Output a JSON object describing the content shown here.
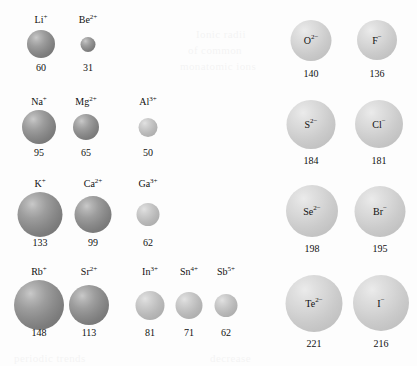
{
  "figure": {
    "background_color": "#fdfdfd",
    "cation_color": "#8b8b8b",
    "cation_light_color": "#bdbdbd",
    "anion_color": "#cbcbcb",
    "text_color": "#111111"
  },
  "bleed_text": [
    {
      "text": "Ionic radii",
      "x": 196,
      "y": 28
    },
    {
      "text": "of common",
      "x": 188,
      "y": 44
    },
    {
      "text": "monatomic ions",
      "x": 180,
      "y": 60
    },
    {
      "text": "periodic trends",
      "x": 14,
      "y": 352
    },
    {
      "text": "decrease",
      "x": 210,
      "y": 352
    }
  ],
  "cations": {
    "label_position": "above-sphere",
    "rows": [
      {
        "row_id": "period-2-cations",
        "label_y": 14,
        "sphere_center_y": 44,
        "value_y": 62,
        "ions": [
          {
            "element": "Li",
            "charge": "+",
            "symbol_html": "Li<sup>+</sup>",
            "radius": "60",
            "diameter_px": 28,
            "center_x": 41,
            "shade": "cation"
          },
          {
            "element": "Be",
            "charge": "2+",
            "symbol_html": "Be<sup>2+</sup>",
            "radius": "31",
            "diameter_px": 15,
            "center_x": 88,
            "shade": "cation"
          }
        ]
      },
      {
        "row_id": "period-3-cations",
        "label_y": 96,
        "sphere_center_y": 127,
        "value_y": 147,
        "ions": [
          {
            "element": "Na",
            "charge": "+",
            "symbol_html": "Na<sup>+</sup>",
            "radius": "95",
            "diameter_px": 34,
            "center_x": 39,
            "shade": "cation"
          },
          {
            "element": "Mg",
            "charge": "2+",
            "symbol_html": "Mg<sup>2+</sup>",
            "radius": "65",
            "diameter_px": 26,
            "center_x": 86,
            "shade": "cation"
          },
          {
            "element": "Al",
            "charge": "3+",
            "symbol_html": "Al<sup>3+</sup>",
            "radius": "50",
            "diameter_px": 19,
            "center_x": 148,
            "shade": "cation-light"
          }
        ]
      },
      {
        "row_id": "period-4-cations",
        "label_y": 178,
        "sphere_center_y": 214,
        "value_y": 237,
        "ions": [
          {
            "element": "K",
            "charge": "+",
            "symbol_html": "K<sup>+</sup>",
            "radius": "133",
            "diameter_px": 45,
            "center_x": 40,
            "shade": "cation"
          },
          {
            "element": "Ca",
            "charge": "2+",
            "symbol_html": "Ca<sup>2+</sup>",
            "radius": "99",
            "diameter_px": 37,
            "center_x": 93,
            "shade": "cation"
          },
          {
            "element": "Ga",
            "charge": "3+",
            "symbol_html": "Ga<sup>3+</sup>",
            "radius": "62",
            "diameter_px": 23,
            "center_x": 148,
            "shade": "cation-light"
          }
        ]
      },
      {
        "row_id": "period-5-cations",
        "label_y": 266,
        "sphere_center_y": 305,
        "value_y": 327,
        "ions": [
          {
            "element": "Rb",
            "charge": "+",
            "symbol_html": "Rb<sup>+</sup>",
            "radius": "148",
            "diameter_px": 50,
            "center_x": 39,
            "shade": "cation"
          },
          {
            "element": "Sr",
            "charge": "2+",
            "symbol_html": "Sr<sup>2+</sup>",
            "radius": "113",
            "diameter_px": 40,
            "center_x": 89,
            "shade": "cation"
          },
          {
            "element": "In",
            "charge": "3+",
            "symbol_html": "In<sup>3+</sup>",
            "radius": "81",
            "diameter_px": 29,
            "center_x": 150,
            "shade": "cation-light"
          },
          {
            "element": "Sn",
            "charge": "4+",
            "symbol_html": "Sn<sup>4+</sup>",
            "radius": "71",
            "diameter_px": 27,
            "center_x": 189,
            "shade": "cation-light"
          },
          {
            "element": "Sb",
            "charge": "5+",
            "symbol_html": "Sb<sup>5+</sup>",
            "radius": "62",
            "diameter_px": 23,
            "center_x": 226,
            "shade": "cation-light"
          }
        ]
      }
    ]
  },
  "anions": {
    "label_position": "inside-sphere",
    "rows": [
      {
        "row_id": "period-2-anions",
        "sphere_center_y": 40,
        "value_y": 68,
        "ions": [
          {
            "element": "O",
            "charge": "2-",
            "symbol_html": "O<sup>2&#8722;</sup>",
            "radius": "140",
            "diameter_px": 41,
            "center_x": 311,
            "shade": "anion"
          },
          {
            "element": "F",
            "charge": "-",
            "symbol_html": "F<sup>&#8722;</sup>",
            "radius": "136",
            "diameter_px": 40,
            "center_x": 377,
            "shade": "anion"
          }
        ]
      },
      {
        "row_id": "period-3-anions",
        "sphere_center_y": 124,
        "value_y": 155,
        "ions": [
          {
            "element": "S",
            "charge": "2-",
            "symbol_html": "S<sup>2&#8722;</sup>",
            "radius": "184",
            "diameter_px": 49,
            "center_x": 311,
            "shade": "anion"
          },
          {
            "element": "Cl",
            "charge": "-",
            "symbol_html": "Cl<sup>&#8722;</sup>",
            "radius": "181",
            "diameter_px": 48,
            "center_x": 379,
            "shade": "anion"
          }
        ]
      },
      {
        "row_id": "period-4-anions",
        "sphere_center_y": 211,
        "value_y": 243,
        "ions": [
          {
            "element": "Se",
            "charge": "2-",
            "symbol_html": "Se<sup>2&#8722;</sup>",
            "radius": "198",
            "diameter_px": 52,
            "center_x": 312,
            "shade": "anion"
          },
          {
            "element": "Br",
            "charge": "-",
            "symbol_html": "Br<sup>&#8722;</sup>",
            "radius": "195",
            "diameter_px": 51,
            "center_x": 380,
            "shade": "anion"
          }
        ]
      },
      {
        "row_id": "period-5-anions",
        "sphere_center_y": 303,
        "value_y": 338,
        "ions": [
          {
            "element": "Te",
            "charge": "2-",
            "symbol_html": "Te<sup>2&#8722;</sup>",
            "radius": "221",
            "diameter_px": 57,
            "center_x": 314,
            "shade": "anion"
          },
          {
            "element": "I",
            "charge": "-",
            "symbol_html": "I<sup>&#8722;</sup>",
            "radius": "216",
            "diameter_px": 56,
            "center_x": 381,
            "shade": "anion"
          }
        ]
      }
    ]
  }
}
